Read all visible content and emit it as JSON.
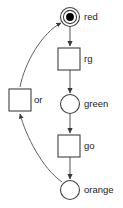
{
  "diagram": {
    "type": "petri-net",
    "colors": {
      "background": "#ffffff",
      "node_stroke": "#404040",
      "node_fill": "#ffffff",
      "arc_stroke": "#606060",
      "token_fill": "#000000",
      "label_text": "#1a1a1a"
    },
    "places": [
      {
        "id": "red",
        "label": "red",
        "shape": "circle",
        "tokens": 1,
        "double_ring": true,
        "cx": 70,
        "cy": 17,
        "r": 9.5,
        "label_x": 84,
        "label_y": 17
      },
      {
        "id": "green",
        "label": "green",
        "shape": "circle",
        "tokens": 0,
        "double_ring": false,
        "cx": 70,
        "cy": 104,
        "r": 9.5,
        "label_x": 84,
        "label_y": 104
      },
      {
        "id": "orange",
        "label": "orange",
        "shape": "circle",
        "tokens": 0,
        "double_ring": false,
        "cx": 70,
        "cy": 190,
        "r": 9.5,
        "label_x": 84,
        "label_y": 190
      }
    ],
    "transitions": [
      {
        "id": "rg",
        "label": "rg",
        "shape": "square",
        "x": 58,
        "y": 48,
        "w": 22,
        "h": 22,
        "label_x": 84,
        "label_y": 59
      },
      {
        "id": "go",
        "label": "go",
        "shape": "square",
        "x": 58,
        "y": 135,
        "w": 22,
        "h": 22,
        "label_x": 84,
        "label_y": 146
      },
      {
        "id": "or",
        "label": "or",
        "shape": "square",
        "x": 9,
        "y": 89,
        "w": 22,
        "h": 22,
        "label_x": 34,
        "label_y": 100
      }
    ],
    "arcs": [
      {
        "id": "red-to-rg",
        "from": "red",
        "to": "rg",
        "kind": "straight",
        "path": "M 70 27 L 70 46"
      },
      {
        "id": "rg-to-green",
        "from": "rg",
        "to": "green",
        "kind": "straight",
        "path": "M 70 70 L 70 93"
      },
      {
        "id": "green-to-go",
        "from": "green",
        "to": "go",
        "kind": "straight",
        "path": "M 70 114 L 70 133"
      },
      {
        "id": "go-to-orange",
        "from": "go",
        "to": "orange",
        "kind": "straight",
        "path": "M 70 157 L 70 179"
      },
      {
        "id": "orange-to-or",
        "from": "orange",
        "to": "or",
        "kind": "curved",
        "path": "M 62 182 C 42 168, 26 136, 20 114"
      },
      {
        "id": "or-to-red",
        "from": "or",
        "to": "red",
        "kind": "curved",
        "path": "M 20 87 C 25 62, 42 33, 61 23"
      }
    ],
    "legend": {
      "place_meaning": "place",
      "transition_meaning": "transition",
      "token_meaning": "token"
    }
  }
}
